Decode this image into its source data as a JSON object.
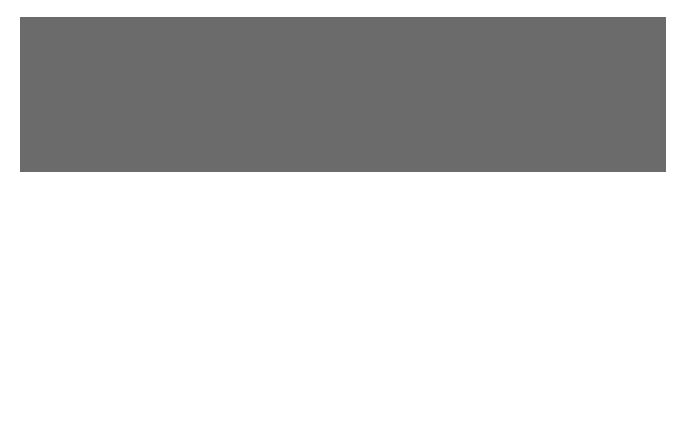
{
  "colors": {
    "sheet": "#6b6b6b",
    "inner": "#262626",
    "grid": "#d8d8d8",
    "star": "#f2f2f2",
    "text_dark": "#111111",
    "text_light": "#e8e8e8"
  },
  "axes": {
    "ra_ticks": [
      {
        "label": "3h",
        "x": 152
      },
      {
        "label": "2h",
        "x": 281
      },
      {
        "label": "1h",
        "x": 409
      },
      {
        "label": "0h",
        "x": 537
      }
    ],
    "dec_ticks": [
      {
        "label": "+10°",
        "y": 64
      },
      {
        "label": "0°",
        "y": 157
      },
      {
        "label": "-10°",
        "y": 250
      },
      {
        "label": "-20°",
        "y": 344
      }
    ]
  },
  "constellations": [
    {
      "name": "ARIES",
      "x": 215,
      "y": 47,
      "dark": true
    },
    {
      "name": "TAURUS",
      "x": 60,
      "y": 87,
      "dark": true
    },
    {
      "name": "PEGASUS",
      "x": 549,
      "y": 47,
      "dark": true
    },
    {
      "name": "PISCES",
      "x": 480,
      "y": 91,
      "dark": true
    },
    {
      "name": "ERIDANUS",
      "x": 109,
      "y": 300,
      "dark": true
    },
    {
      "name": "CETUS",
      "x": 378,
      "y": 299,
      "dark": true
    },
    {
      "name": "AQUARIUS",
      "x": 571,
      "y": 309,
      "dark": true
    },
    {
      "name": "FORNAX",
      "x": 253,
      "y": 403,
      "dark": true
    },
    {
      "name": "SCULPTOR",
      "x": 467,
      "y": 403,
      "dark": true
    }
  ],
  "annotations": {
    "ecliptic": "Ecliptic",
    "credit": "W.L. TIRION",
    "mira": "Mira"
  },
  "object_labels": [
    {
      "t": "864",
      "x": 256,
      "y": 105
    },
    {
      "t": "1073",
      "x": 171,
      "y": 146
    },
    {
      "t": "1055",
      "x": 173,
      "y": 152
    },
    {
      "t": "M77",
      "x": 171,
      "y": 159
    },
    {
      "t": "1087",
      "x": 161,
      "y": 165
    },
    {
      "t": "95",
      "x": 111,
      "y": 165
    },
    {
      "t": "94",
      "x": 124,
      "y": 167
    },
    {
      "t": "69",
      "x": 237,
      "y": 155
    },
    {
      "t": "936",
      "x": 218,
      "y": 164
    },
    {
      "t": "70",
      "x": 238,
      "y": 167
    },
    {
      "t": "60",
      "x": 273,
      "y": 153
    },
    {
      "t": "61",
      "x": 271,
      "y": 167
    },
    {
      "t": "75",
      "x": 204,
      "y": 170
    },
    {
      "t": "66",
      "x": 258,
      "y": 183
    },
    {
      "t": "895",
      "x": 220,
      "y": 211
    },
    {
      "t": "779",
      "x": 288,
      "y": 214
    },
    {
      "t": "1052",
      "x": 186,
      "y": 230
    },
    {
      "t": "1042",
      "x": 198,
      "y": 241
    },
    {
      "t": "AR",
      "x": 269,
      "y": 238
    },
    {
      "t": "584",
      "x": 339,
      "y": 216
    },
    {
      "t": "42",
      "x": 371,
      "y": 162
    },
    {
      "t": "39",
      "x": 366,
      "y": 180
    },
    {
      "t": "Σ31",
      "x": 399,
      "y": 173
    },
    {
      "t": "20",
      "x": 427,
      "y": 169
    },
    {
      "t": "1613",
      "x": 442,
      "y": 137
    },
    {
      "t": "26",
      "x": 412,
      "y": 147
    },
    {
      "t": "428",
      "x": 392,
      "y": 148
    },
    {
      "t": "12",
      "x": 452,
      "y": 190
    },
    {
      "t": "25",
      "x": 407,
      "y": 204
    },
    {
      "t": "37",
      "x": 383,
      "y": 232
    },
    {
      "t": "157",
      "x": 466,
      "y": 237
    },
    {
      "t": "Σ147",
      "x": 323,
      "y": 263
    },
    {
      "t": "246",
      "x": 424,
      "y": 274
    },
    {
      "t": "210",
      "x": 447,
      "y": 282
    },
    {
      "t": "720",
      "x": 281,
      "y": 287
    },
    {
      "t": "50",
      "x": 332,
      "y": 298
    },
    {
      "t": "46",
      "x": 358,
      "y": 294
    },
    {
      "t": "H80",
      "x": 229,
      "y": 303
    },
    {
      "t": "6",
      "x": 515,
      "y": 302
    },
    {
      "t": "2",
      "x": 532,
      "y": 320
    },
    {
      "t": "7",
      "x": 508,
      "y": 335
    },
    {
      "t": "h2043",
      "x": 364,
      "y": 336
    },
    {
      "t": "247",
      "x": 438,
      "y": 352
    },
    {
      "t": "908",
      "x": 236,
      "y": 356
    },
    {
      "t": "57",
      "x": 257,
      "y": 350
    },
    {
      "t": "48",
      "x": 347,
      "y": 358
    },
    {
      "t": "578",
      "x": 348,
      "y": 370
    },
    {
      "t": "56",
      "x": 262,
      "y": 368
    },
    {
      "t": "Stm3",
      "x": 412,
      "y": 369
    },
    {
      "t": "Stm4",
      "x": 410,
      "y": 384
    },
    {
      "t": "45",
      "x": 496,
      "y": 373
    },
    {
      "t": "3",
      "x": 518,
      "y": 257
    }
  ],
  "legend": {
    "title": "Magnitudes:",
    "magnitudes": [
      {
        "label": "-1",
        "r": 5.5
      },
      {
        "label": "0",
        "r": 5
      },
      {
        "label": "1",
        "r": 4.5
      },
      {
        "label": "2",
        "r": 4
      },
      {
        "label": "3",
        "r": 3.3
      },
      {
        "label": "4",
        "r": 2.7
      },
      {
        "label": "5",
        "r": 2
      },
      {
        "label": "6",
        "r": 1.3
      }
    ],
    "and_under": [
      "and",
      "under"
    ],
    "items": [
      {
        "label": [
          "Double or",
          "multiple stars"
        ]
      },
      {
        "label": [
          "Variable stars"
        ]
      },
      {
        "label": [
          "Open clusters"
        ]
      },
      {
        "label": [
          "Globular",
          "clusters"
        ]
      },
      {
        "label": [
          "Bright nebulae"
        ]
      },
      {
        "label": [
          "Dark nebulae"
        ]
      },
      {
        "label": [
          "Planetary",
          "nebulae"
        ]
      },
      {
        "label": [
          "Galaxies"
        ]
      },
      {
        "label": [
          "Quasars"
        ]
      }
    ]
  }
}
